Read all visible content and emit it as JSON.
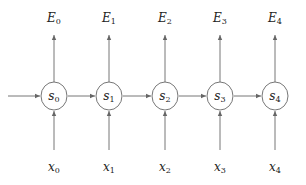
{
  "diagram": {
    "type": "recurrent-state-chain",
    "nodes": [
      {
        "id": "s0",
        "base": "s",
        "sub": "0",
        "cx": 54
      },
      {
        "id": "s1",
        "base": "s",
        "sub": "1",
        "cx": 109
      },
      {
        "id": "s2",
        "base": "s",
        "sub": "2",
        "cx": 165
      },
      {
        "id": "s3",
        "base": "s",
        "sub": "3",
        "cx": 220
      },
      {
        "id": "s4",
        "base": "s",
        "sub": "4",
        "cx": 275
      }
    ],
    "outputs": [
      {
        "base": "E",
        "sub": "0"
      },
      {
        "base": "E",
        "sub": "1"
      },
      {
        "base": "E",
        "sub": "2"
      },
      {
        "base": "E",
        "sub": "3"
      },
      {
        "base": "E",
        "sub": "4"
      }
    ],
    "inputs": [
      {
        "base": "x",
        "sub": "0"
      },
      {
        "base": "x",
        "sub": "1"
      },
      {
        "base": "x",
        "sub": "2"
      },
      {
        "base": "x",
        "sub": "3"
      },
      {
        "base": "x",
        "sub": "4"
      }
    ],
    "edges": [
      {
        "from": "start",
        "to": "s0"
      },
      {
        "from": "s0",
        "to": "s1"
      },
      {
        "from": "s1",
        "to": "s2"
      },
      {
        "from": "s2",
        "to": "s3"
      },
      {
        "from": "s3",
        "to": "s4"
      },
      {
        "from": "x0",
        "to": "s0"
      },
      {
        "from": "x1",
        "to": "s1"
      },
      {
        "from": "x2",
        "to": "s2"
      },
      {
        "from": "x3",
        "to": "s3"
      },
      {
        "from": "x4",
        "to": "s4"
      },
      {
        "from": "s0",
        "to": "E0"
      },
      {
        "from": "s1",
        "to": "E1"
      },
      {
        "from": "s2",
        "to": "E2"
      },
      {
        "from": "s3",
        "to": "E3"
      },
      {
        "from": "s4",
        "to": "E4"
      }
    ],
    "colors": {
      "stroke": "#666666",
      "text": "#222222",
      "background": "#ffffff"
    }
  }
}
